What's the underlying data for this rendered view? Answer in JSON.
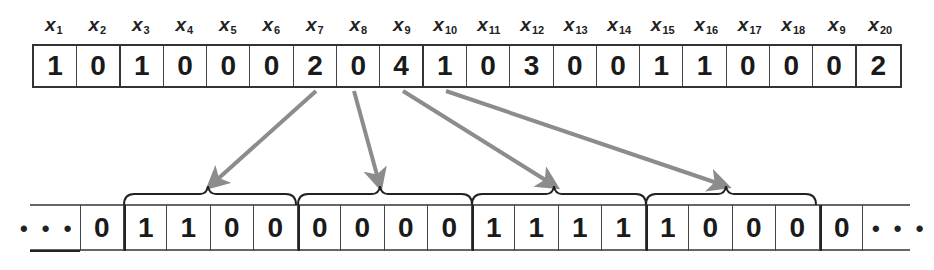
{
  "top_sequence": {
    "labels": [
      {
        "base": "x",
        "sub": "1"
      },
      {
        "base": "x",
        "sub": "2"
      },
      {
        "base": "x",
        "sub": "3"
      },
      {
        "base": "x",
        "sub": "4"
      },
      {
        "base": "x",
        "sub": "5"
      },
      {
        "base": "x",
        "sub": "6"
      },
      {
        "base": "x",
        "sub": "7"
      },
      {
        "base": "x",
        "sub": "8"
      },
      {
        "base": "x",
        "sub": "9"
      },
      {
        "base": "x",
        "sub": "10"
      },
      {
        "base": "x",
        "sub": "11"
      },
      {
        "base": "x",
        "sub": "12"
      },
      {
        "base": "x",
        "sub": "13"
      },
      {
        "base": "x",
        "sub": "14"
      },
      {
        "base": "x",
        "sub": "15"
      },
      {
        "base": "x",
        "sub": "16"
      },
      {
        "base": "x",
        "sub": "17"
      },
      {
        "base": "x",
        "sub": "18"
      },
      {
        "base": "x",
        "sub": "9"
      },
      {
        "base": "x",
        "sub": "20"
      }
    ],
    "values": [
      "1",
      "0",
      "1",
      "0",
      "0",
      "0",
      "2",
      "0",
      "4",
      "1",
      "0",
      "3",
      "0",
      "0",
      "1",
      "1",
      "0",
      "0",
      "0",
      "2"
    ]
  },
  "bottom_sequence": {
    "leading_ellipsis": "• • •",
    "trailing_ellipsis": "• • •",
    "values": [
      "0",
      "1",
      "1",
      "0",
      "0",
      "0",
      "0",
      "0",
      "0",
      "1",
      "1",
      "1",
      "1",
      "1",
      "0",
      "0",
      "0",
      "0"
    ],
    "groups": [
      {
        "source_index": 7,
        "start": 1,
        "length": 4
      },
      {
        "source_index": 8,
        "start": 5,
        "length": 4
      },
      {
        "source_index": 9,
        "start": 9,
        "length": 4
      },
      {
        "source_index": 10,
        "start": 13,
        "length": 4
      }
    ]
  },
  "colors": {
    "arrow": "#8c8c8c",
    "border": "#333333",
    "text": "#1a1a1a"
  }
}
